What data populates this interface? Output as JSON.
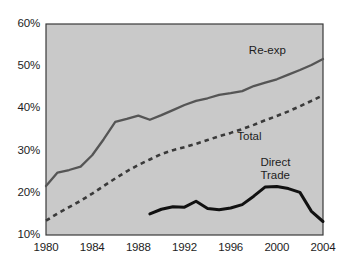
{
  "chart_data": {
    "type": "line",
    "title": "",
    "subtitle": "",
    "xlabel": "",
    "ylabel": "",
    "xlim": [
      1980,
      2004
    ],
    "ylim": [
      10,
      60
    ],
    "ytick_labels": [
      "60%",
      "50%",
      "40%",
      "30%",
      "20%",
      "10%"
    ],
    "ytick_values": [
      60,
      50,
      40,
      30,
      20,
      10
    ],
    "xtick_labels": [
      "1980",
      "1984",
      "1988",
      "1992",
      "1996",
      "2000",
      "2004"
    ],
    "xtick_values": [
      1980,
      1984,
      1988,
      1992,
      1996,
      2000,
      2004
    ],
    "grid": false,
    "legend_position": "inline-annotations",
    "plot_background": "#c9c9c9",
    "series": [
      {
        "name": "Re-exp",
        "label": "Re-exp",
        "style": "solid",
        "color": "#555555",
        "label_x": 2000,
        "label_y": 53.5,
        "x": [
          1980,
          1981,
          1982,
          1983,
          1984,
          1985,
          1986,
          1987,
          1988,
          1989,
          1990,
          1991,
          1992,
          1993,
          1994,
          1995,
          1996,
          1997,
          1998,
          1999,
          2000,
          2001,
          2002,
          2003,
          2004
        ],
        "values": [
          21.6,
          24.8,
          25.4,
          26.2,
          28.9,
          32.7,
          36.8,
          37.5,
          38.3,
          37.3,
          38.4,
          39.6,
          40.8,
          41.8,
          42.4,
          43.2,
          43.6,
          44.1,
          45.3,
          46.1,
          46.9,
          48.0,
          49.1,
          50.3,
          51.7
        ]
      },
      {
        "name": "Total",
        "label": "Total",
        "style": "dotted",
        "color": "#3a3a3a",
        "label_x": 1999,
        "label_y": 33.2,
        "x": [
          1980,
          1981,
          1982,
          1983,
          1984,
          1985,
          1986,
          1987,
          1988,
          1989,
          1990,
          1991,
          1992,
          1993,
          1994,
          1995,
          1996,
          1997,
          1998,
          1999,
          2000,
          2001,
          2002,
          2003,
          2004
        ],
        "values": [
          13.4,
          15.1,
          16.6,
          18.1,
          19.8,
          21.6,
          23.4,
          25.1,
          26.6,
          27.9,
          29.2,
          30.1,
          30.8,
          31.6,
          32.5,
          33.4,
          34.2,
          35.1,
          36.1,
          37.2,
          38.2,
          39.3,
          40.5,
          41.8,
          43.1
        ]
      },
      {
        "name": "Direct Trade",
        "label": "Direct\nTrade",
        "label_line1": "Direct",
        "label_line2": "Trade",
        "style": "solid-thick",
        "color": "#111111",
        "label_x": 2001,
        "label_y": 27.0,
        "x": [
          1989,
          1990,
          1991,
          1992,
          1993,
          1994,
          1995,
          1996,
          1997,
          1998,
          1999,
          2000,
          2001,
          2002,
          2003,
          2004
        ],
        "values": [
          15.0,
          16.1,
          16.7,
          16.6,
          18.0,
          16.3,
          16.0,
          16.4,
          17.2,
          19.2,
          21.4,
          21.5,
          21.0,
          20.1,
          15.6,
          13.2
        ]
      }
    ]
  }
}
